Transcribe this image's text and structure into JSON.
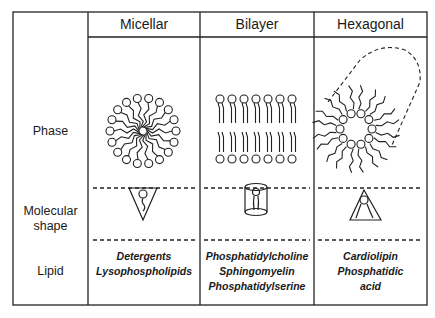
{
  "columns": [
    {
      "header": "Micellar",
      "lipids": [
        "Detergents",
        "Lysophospholipids"
      ]
    },
    {
      "header": "Bilayer",
      "lipids": [
        "Phosphatidylcholine",
        "Sphingomyelin",
        "Phosphatidylserine"
      ]
    },
    {
      "header": "Hexagonal",
      "lipids": [
        "Cardiolipin",
        "Phosphatidic",
        "acid"
      ]
    }
  ],
  "rows": {
    "phase": "Phase",
    "molecular_shape_1": "Molecular",
    "molecular_shape_2": "shape",
    "lipid": "Lipid"
  },
  "shapes": {
    "micellar": "inverted-cone",
    "bilayer": "cylinder",
    "hexagonal": "cone"
  }
}
